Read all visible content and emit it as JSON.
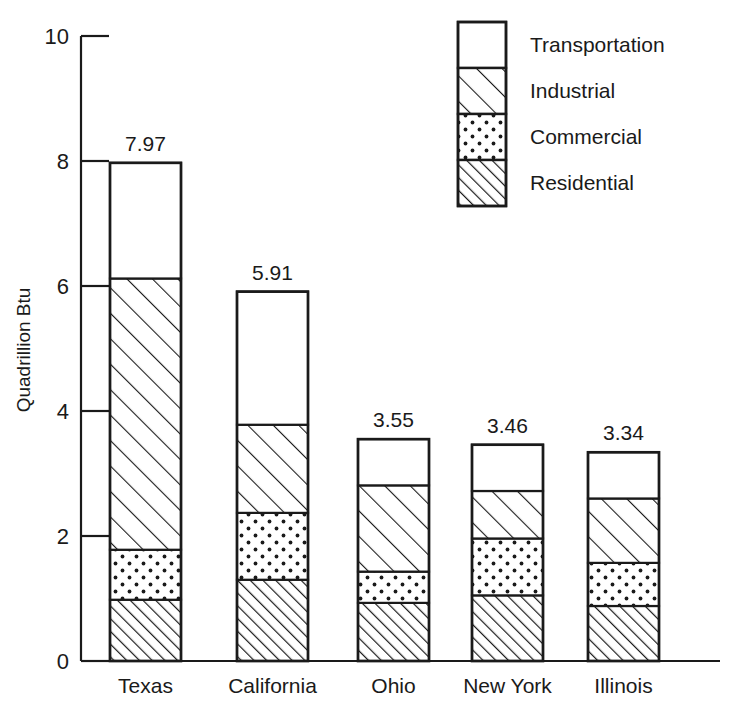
{
  "chart_data": {
    "type": "bar",
    "subtype": "stacked-bar",
    "title": "",
    "xlabel": "",
    "ylabel": "Quadrillion Btu",
    "ylim": [
      0,
      10
    ],
    "yticks": [
      "0",
      "2",
      "4",
      "6",
      "8",
      "10"
    ],
    "ytick_values": [
      0,
      2,
      4,
      6,
      8,
      10
    ],
    "grid": false,
    "legend_position": "top-right",
    "categories": [
      "Texas",
      "California",
      "Ohio",
      "New York",
      "Illinois"
    ],
    "totals": [
      "7.97",
      "5.91",
      "3.55",
      "3.46",
      "3.34"
    ],
    "total_values": [
      7.97,
      5.91,
      3.55,
      3.46,
      3.34
    ],
    "series": [
      {
        "name": "Residential",
        "pattern": "dense-diagonal-hatch",
        "values": [
          0.98,
          1.3,
          0.93,
          1.05,
          0.88
        ]
      },
      {
        "name": "Commercial",
        "pattern": "dots",
        "values": [
          0.8,
          1.07,
          0.5,
          0.91,
          0.69
        ]
      },
      {
        "name": "Industrial",
        "pattern": "sparse-diagonal-hatch",
        "values": [
          4.34,
          1.41,
          1.38,
          0.76,
          1.03
        ]
      },
      {
        "name": "Transportation",
        "pattern": "blank",
        "values": [
          1.85,
          2.13,
          0.74,
          0.74,
          0.74
        ]
      }
    ],
    "legend_order_top_to_bottom": [
      "Transportation",
      "Industrial",
      "Commercial",
      "Residential"
    ]
  },
  "colors": {
    "ink": "#1a1a1a",
    "background": "#ffffff"
  }
}
